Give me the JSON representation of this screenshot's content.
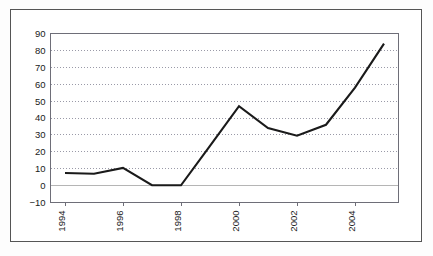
{
  "chart_data": {
    "type": "line",
    "title": "",
    "subtitle": "",
    "xlabel": "",
    "ylabel": "",
    "grid": true,
    "legend": false,
    "legend_position": "none",
    "line_color": "#1a1a1a",
    "gridline_color": "#9a9aa8",
    "axis_color": "#6e6e78",
    "zero_line_color": "#b5b5b5",
    "background_color": "#ffffff",
    "frame_color": "#555555",
    "xlim": [
      1993.5,
      2005.5
    ],
    "ylim": [
      -10,
      90
    ],
    "ytick_step": 10,
    "yticks": [
      -10,
      0,
      10,
      20,
      30,
      40,
      50,
      60,
      70,
      80,
      90
    ],
    "ytick_labels": [
      "−10",
      "0",
      "10",
      "20",
      "30",
      "40",
      "50",
      "60",
      "70",
      "80",
      "90"
    ],
    "xticks": [
      1994,
      1996,
      1998,
      2000,
      2002,
      2004
    ],
    "xtick_labels": [
      "1994",
      "1996",
      "1998",
      "2000",
      "2002",
      "2004"
    ],
    "xtick_rotation": 90,
    "x": [
      1994,
      1995,
      1996,
      1997,
      1998,
      1999,
      2000,
      2001,
      2002,
      2003,
      2004,
      2005
    ],
    "series": [
      {
        "name": "series-1",
        "values": [
          7.5,
          7.0,
          10.5,
          0.2,
          0.2,
          23.5,
          47.0,
          34.0,
          29.5,
          36.0,
          58.0,
          84.0
        ]
      }
    ]
  }
}
